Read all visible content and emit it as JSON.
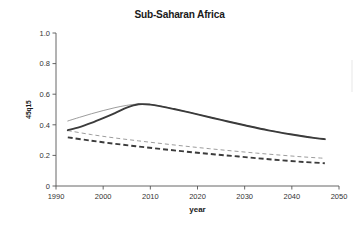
{
  "chart_data": {
    "type": "line",
    "title": "Sub-Saharan Africa",
    "xlabel": "year",
    "ylabel": "45q15",
    "xlim": [
      1990,
      2050
    ],
    "ylim": [
      0,
      1.0
    ],
    "xticks": [
      1990,
      2000,
      2010,
      2020,
      2030,
      2040,
      2050
    ],
    "yticks": [
      "0",
      "0.2",
      "0.4",
      "0.6",
      "0.8",
      "1.0"
    ],
    "grid": false,
    "legend": "none",
    "series": [
      {
        "name": "male-solid-thick",
        "style": "solid",
        "width": "thick",
        "color": "#3b3b3b",
        "x": [
          1992.5,
          1995,
          1997.5,
          2000,
          2002.5,
          2005,
          2007.5,
          2010,
          2012.5,
          2015,
          2017.5,
          2020,
          2025,
          2030,
          2035,
          2040,
          2045,
          2047
        ],
        "values": [
          0.365,
          0.385,
          0.412,
          0.443,
          0.476,
          0.512,
          0.534,
          0.532,
          0.519,
          0.503,
          0.486,
          0.468,
          0.432,
          0.397,
          0.364,
          0.337,
          0.313,
          0.306
        ]
      },
      {
        "name": "female-solid-thin",
        "style": "solid",
        "width": "thin",
        "color": "#8a8a8a",
        "x": [
          1992.5,
          1995,
          1997.5,
          2000,
          2002.5,
          2005,
          2007.5,
          2010,
          2012.5,
          2015,
          2017.5,
          2020,
          2025,
          2030,
          2035,
          2040,
          2045,
          2047
        ],
        "values": [
          0.425,
          0.449,
          0.472,
          0.493,
          0.512,
          0.527,
          0.536,
          0.533,
          0.52,
          0.504,
          0.487,
          0.469,
          0.433,
          0.398,
          0.365,
          0.338,
          0.314,
          0.307
        ]
      },
      {
        "name": "male-dashed-thin",
        "style": "dashed",
        "width": "thin",
        "color": "#8a8a8a",
        "x": [
          1992.5,
          1997.5,
          2002.5,
          2007.5,
          2012.5,
          2017.5,
          2022.5,
          2027.5,
          2032.5,
          2037.5,
          2042.5,
          2047
        ],
        "values": [
          0.362,
          0.336,
          0.314,
          0.295,
          0.277,
          0.26,
          0.244,
          0.229,
          0.215,
          0.202,
          0.19,
          0.181
        ]
      },
      {
        "name": "female-dashed-thick",
        "style": "dashed",
        "width": "thick",
        "color": "#3b3b3b",
        "x": [
          1992.5,
          1997.5,
          2002.5,
          2007.5,
          2012.5,
          2017.5,
          2022.5,
          2027.5,
          2032.5,
          2037.5,
          2042.5,
          2047
        ],
        "values": [
          0.318,
          0.296,
          0.276,
          0.258,
          0.241,
          0.225,
          0.21,
          0.196,
          0.182,
          0.169,
          0.157,
          0.149
        ]
      }
    ]
  }
}
